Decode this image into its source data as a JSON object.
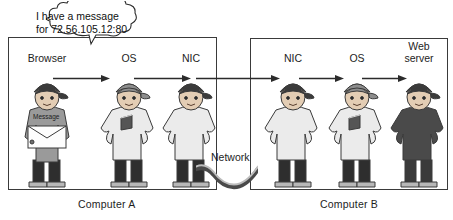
{
  "diagram": {
    "speech_bubble": {
      "text": "I have a message\nfor 72.56.105.12:80"
    },
    "envelope": {
      "label": "Message"
    },
    "network": {
      "label": "Network"
    },
    "computer_a": {
      "caption": "Computer A",
      "roles": [
        {
          "label": "Browser"
        },
        {
          "label": "OS"
        },
        {
          "label": "NIC"
        }
      ]
    },
    "computer_b": {
      "caption": "Computer B",
      "roles": [
        {
          "label": "NIC"
        },
        {
          "label": "OS"
        },
        {
          "label": "Web\nserver"
        }
      ]
    },
    "colors": {
      "outline": "#3a3a3a",
      "skin": "#e3cdb4",
      "hat_dark": "#3b3b3b",
      "hat_mid": "#8d8d8d",
      "shirt_light": "#ebebeb",
      "shirt_mid": "#9a9a9a",
      "shirt_dark": "#4a4a4a",
      "pants": "#2e2e2e",
      "shoes": "#b8b8b8",
      "paper": "#fdfdfd",
      "logo": "#555555"
    }
  }
}
